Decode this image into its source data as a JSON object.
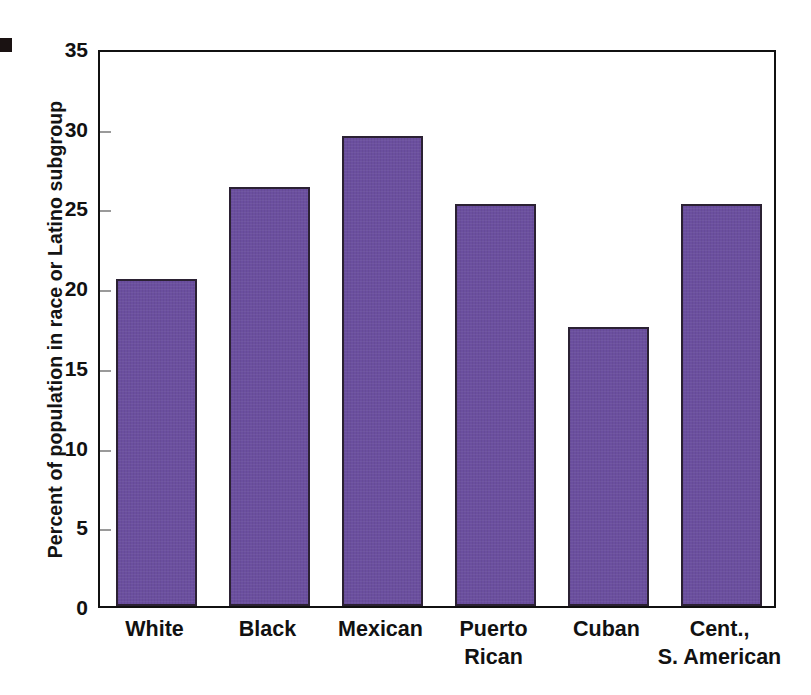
{
  "figure": {
    "marker_name": "figure-bullet-square",
    "background_color": "#ffffff",
    "frame_color": "#111111"
  },
  "chart_data": {
    "type": "bar",
    "title": "",
    "xlabel": "",
    "ylabel": "Percent of population in race or Latino subgroup",
    "categories": [
      "White",
      "Black",
      "Mexican",
      "Puerto\nRican",
      "Cuban",
      "Cent.,\nS. American"
    ],
    "values": [
      20.5,
      26.3,
      29.5,
      25.2,
      17.5,
      25.2
    ],
    "ylim": [
      0,
      35
    ],
    "yticks": [
      0,
      5,
      10,
      15,
      20,
      25,
      30,
      35
    ],
    "ytick_labels": [
      "0",
      "5",
      "10",
      "15",
      "20",
      "25",
      "30",
      "35"
    ],
    "grid": false,
    "legend": null,
    "bar_color": "#6b4f9f",
    "bar_edge_color": "#2b2133"
  }
}
